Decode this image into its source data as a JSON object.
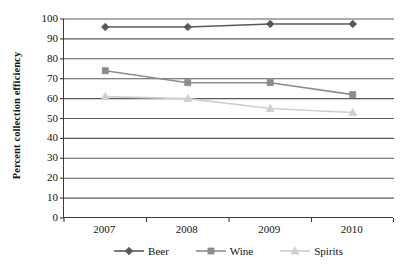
{
  "chart_data": {
    "type": "line",
    "title": "",
    "xlabel": "",
    "ylabel": "Percent collection efficiency",
    "categories": [
      "2007",
      "2008",
      "2009",
      "2010"
    ],
    "ylim": [
      0,
      100
    ],
    "ytick_step": 10,
    "yticks": [
      "100",
      "90",
      "80",
      "70",
      "60",
      "50",
      "40",
      "30",
      "20",
      "10",
      "0"
    ],
    "grid": "horizontal",
    "legend_position": "bottom",
    "series": [
      {
        "name": "Beer",
        "values": [
          96,
          96,
          97.5,
          97.5
        ],
        "color": "#595959",
        "marker": "diamond"
      },
      {
        "name": "Wine",
        "values": [
          74,
          68,
          68,
          62
        ],
        "color": "#8c8c8c",
        "marker": "square"
      },
      {
        "name": "Spirits",
        "values": [
          61,
          60,
          55,
          53
        ],
        "color": "#cfcfcf",
        "marker": "triangle"
      }
    ]
  },
  "axes": {
    "axis_line_color": "#3b3b3b",
    "gridline_color": "#5a5a5a"
  }
}
